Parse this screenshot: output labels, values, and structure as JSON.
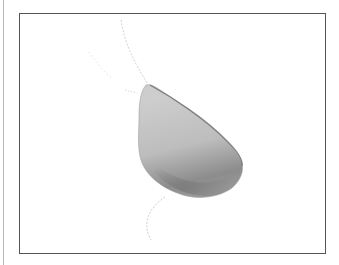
{
  "figure": {
    "frame_color": "#555555",
    "shape_colors": {
      "light": "#c8c8c8",
      "mid": "#a9a9a9",
      "dark": "#7d7d7d",
      "stroke": "#6a6a6a",
      "stalk": "#cfcfcf"
    }
  }
}
